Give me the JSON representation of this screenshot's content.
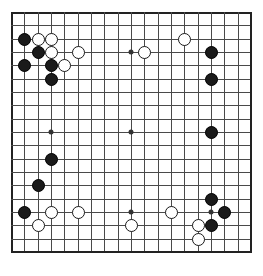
{
  "board": {
    "name": "go-board",
    "size": 19,
    "origin_x": 0.5,
    "origin_y": 0.5,
    "spacing": 13.33,
    "stone_diameter": 13.2,
    "line_color": "#4a4a4a",
    "edge_color": "#222222",
    "background_color": "#ffffff",
    "black_color": "#1a1a1a",
    "white_color": "#ffffff",
    "star_points": [
      {
        "col": 3,
        "row": 3
      },
      {
        "col": 9,
        "row": 3
      },
      {
        "col": 15,
        "row": 3
      },
      {
        "col": 3,
        "row": 9
      },
      {
        "col": 9,
        "row": 9
      },
      {
        "col": 15,
        "row": 9
      },
      {
        "col": 3,
        "row": 15
      },
      {
        "col": 9,
        "row": 15
      },
      {
        "col": 15,
        "row": 15
      }
    ],
    "stones": [
      {
        "color": "black",
        "col": 1,
        "row": 2
      },
      {
        "color": "white",
        "col": 2,
        "row": 2
      },
      {
        "color": "white",
        "col": 3,
        "row": 2
      },
      {
        "color": "black",
        "col": 2,
        "row": 3
      },
      {
        "color": "white",
        "col": 3,
        "row": 3
      },
      {
        "color": "white",
        "col": 5,
        "row": 3
      },
      {
        "color": "white",
        "col": 10,
        "row": 3
      },
      {
        "color": "white",
        "col": 13,
        "row": 2
      },
      {
        "color": "black",
        "col": 15,
        "row": 3
      },
      {
        "color": "black",
        "col": 1,
        "row": 4
      },
      {
        "color": "black",
        "col": 3,
        "row": 4
      },
      {
        "color": "white",
        "col": 4,
        "row": 4
      },
      {
        "color": "black",
        "col": 3,
        "row": 5
      },
      {
        "color": "black",
        "col": 15,
        "row": 5
      },
      {
        "color": "black",
        "col": 15,
        "row": 9
      },
      {
        "color": "black",
        "col": 3,
        "row": 11
      },
      {
        "color": "black",
        "col": 2,
        "row": 13
      },
      {
        "color": "black",
        "col": 15,
        "row": 14
      },
      {
        "color": "black",
        "col": 1,
        "row": 15
      },
      {
        "color": "white",
        "col": 3,
        "row": 15
      },
      {
        "color": "white",
        "col": 5,
        "row": 15
      },
      {
        "color": "white",
        "col": 12,
        "row": 15
      },
      {
        "color": "black",
        "col": 16,
        "row": 15
      },
      {
        "color": "white",
        "col": 2,
        "row": 16
      },
      {
        "color": "white",
        "col": 9,
        "row": 16
      },
      {
        "color": "white",
        "col": 14,
        "row": 16
      },
      {
        "color": "black",
        "col": 15,
        "row": 16
      },
      {
        "color": "white",
        "col": 14,
        "row": 17
      }
    ]
  }
}
